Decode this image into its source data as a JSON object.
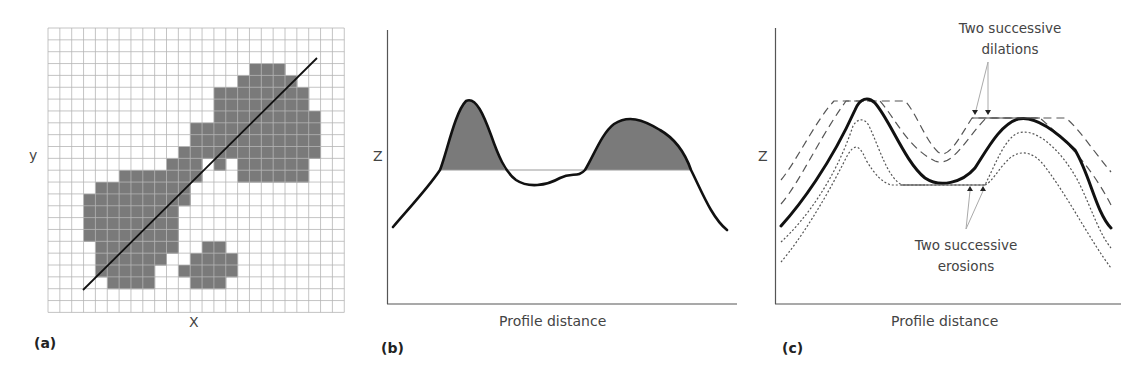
{
  "figure": {
    "panels": [
      {
        "tag": "(a)",
        "x_label": "X",
        "y_label": "y",
        "description": "Raster grid with shaded DEM region and a diagonal profile transect"
      },
      {
        "tag": "(b)",
        "x_label": "Profile distance",
        "y_label": "Z",
        "description": "Elevation profile with two shaded peaks above a horizontal threshold level"
      },
      {
        "tag": "(c)",
        "x_label": "Profile distance",
        "y_label": "Z",
        "annotations": {
          "dilations_line1": "Two successive",
          "dilations_line2": "dilations",
          "erosions_line1": "Two successive",
          "erosions_line2": "erosions"
        },
        "description": "Original profile (bold) with two successive dilations (dashed) and two successive erosions (dotted)"
      }
    ]
  },
  "chart_data": [
    {
      "type": "heatmap",
      "title": "(a)",
      "xlabel": "X",
      "ylabel": "y",
      "data_provenance": "Reconstructed, not read from the figure. The figure shows no numeric values; the grid size and shaded cells were traced by eye from zoomed pixels and are approximate.",
      "grid": {
        "cols": 25,
        "rows": 24,
        "cell_px": 11.85,
        "origin_px": [
          48,
          28
        ]
      },
      "shaded_cells_by_row": {
        "3": [
          17,
          18,
          19
        ],
        "4": [
          16,
          17,
          18,
          19,
          20
        ],
        "5": [
          14,
          15,
          16,
          17,
          18,
          19,
          20,
          21
        ],
        "6": [
          14,
          15,
          16,
          17,
          18,
          19,
          20,
          21
        ],
        "7": [
          14,
          15,
          16,
          17,
          18,
          19,
          20,
          21,
          22
        ],
        "8": [
          12,
          13,
          14,
          15,
          16,
          17,
          18,
          19,
          20,
          21,
          22
        ],
        "9": [
          12,
          13,
          14,
          15,
          16,
          17,
          18,
          19,
          20,
          21,
          22
        ],
        "10": [
          11,
          12,
          13,
          14,
          15,
          16,
          17,
          18,
          19,
          20,
          21,
          22
        ],
        "11": [
          10,
          11,
          12,
          14,
          16,
          17,
          18,
          19,
          20,
          21
        ],
        "12": [
          6,
          7,
          8,
          9,
          10,
          11,
          12,
          16,
          17,
          18,
          19,
          20,
          21
        ],
        "13": [
          4,
          5,
          6,
          7,
          8,
          9,
          10,
          11
        ],
        "14": [
          3,
          4,
          5,
          6,
          7,
          8,
          9,
          10,
          11
        ],
        "15": [
          3,
          4,
          5,
          6,
          7,
          8,
          9,
          10
        ],
        "16": [
          3,
          4,
          5,
          6,
          7,
          8,
          9,
          10
        ],
        "17": [
          3,
          4,
          5,
          6,
          7,
          8,
          9,
          10
        ],
        "18": [
          4,
          5,
          6,
          7,
          8,
          9,
          10,
          13,
          14
        ],
        "19": [
          4,
          5,
          6,
          7,
          8,
          9,
          12,
          13,
          14,
          15
        ],
        "20": [
          4,
          5,
          6,
          7,
          8,
          11,
          12,
          13,
          14,
          15
        ],
        "21": [
          5,
          6,
          7,
          8,
          12,
          13,
          14
        ]
      },
      "transect_px": [
        [
          83,
          290
        ],
        [
          317,
          58
        ]
      ]
    },
    {
      "type": "line",
      "title": "(b)",
      "xlabel": "Profile distance",
      "ylabel": "Z",
      "data_provenance": "Reconstructed, not read from the figure. The figure has no axis ticks or values; the curve was traced by eye in pixel space and the threshold level is estimated.",
      "grid": false,
      "profile_px": [
        [
          393,
          227
        ],
        [
          440,
          170
        ],
        [
          461,
          102
        ],
        [
          470,
          102
        ],
        [
          500,
          160
        ],
        [
          540,
          185
        ],
        [
          560,
          183
        ],
        [
          585,
          165
        ],
        [
          627,
          119
        ],
        [
          660,
          135
        ],
        [
          690,
          168
        ],
        [
          727,
          230
        ]
      ],
      "threshold_level_px": 170,
      "shaded_regions": "areas of the profile above the threshold level (two peaks)"
    },
    {
      "type": "line",
      "title": "(c)",
      "xlabel": "Profile distance",
      "ylabel": "Z",
      "data_provenance": "Reconstructed, not read from the figure. The figure has no axis ticks or values; the curves were traced by eye in pixel space.",
      "grid": false,
      "series": [
        {
          "name": "Original profile",
          "style": "bold solid"
        },
        {
          "name": "Dilation 1",
          "style": "dashed"
        },
        {
          "name": "Dilation 2",
          "style": "dashed"
        },
        {
          "name": "Erosion 1",
          "style": "dotted"
        },
        {
          "name": "Erosion 2",
          "style": "dotted"
        }
      ],
      "annotations": [
        "Two successive dilations",
        "Two successive erosions"
      ]
    }
  ]
}
